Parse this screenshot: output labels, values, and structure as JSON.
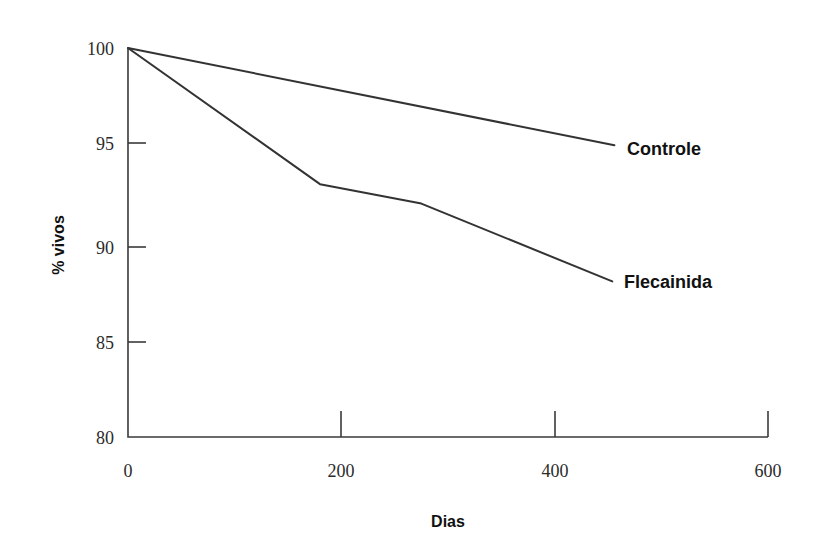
{
  "chart_data": {
    "type": "line",
    "title": "",
    "subtitle": "",
    "xlabel": "Dias",
    "ylabel": "% vivos",
    "xlim": [
      0,
      600
    ],
    "ylim": [
      80,
      100
    ],
    "xticks": [
      0,
      200,
      400,
      600
    ],
    "yticks": [
      80,
      85,
      90,
      95,
      100
    ],
    "xtick_labels": [
      "0",
      "200",
      "400",
      "600"
    ],
    "ytick_labels": [
      "80",
      "85",
      "90",
      "95",
      "100"
    ],
    "grid": false,
    "legend_position": "inline-right-of-line-end",
    "line_color": "#333333",
    "axis_color": "#3a3a3a",
    "background_color": "#ffffff",
    "series": [
      {
        "name": "Controle",
        "label": "Controle",
        "x": [
          0,
          456
        ],
        "y": [
          100,
          95
        ],
        "points": [
          [
            0,
            100
          ],
          [
            456,
            95
          ]
        ]
      },
      {
        "name": "Flecainida",
        "label": "Flecainida",
        "x": [
          0,
          180,
          275,
          454
        ],
        "y": [
          100,
          93,
          92,
          88
        ],
        "points": [
          [
            0,
            100
          ],
          [
            180,
            93
          ],
          [
            275,
            92
          ],
          [
            454,
            88
          ]
        ]
      }
    ]
  },
  "axes": {
    "y_title": "% vivos",
    "x_title": "Dias"
  },
  "labels": {
    "controle": "Controle",
    "flecainida": "Flecainida"
  },
  "ticks": {
    "y": [
      "100",
      "95",
      "90",
      "85",
      "80"
    ],
    "x": [
      "0",
      "200",
      "400",
      "600"
    ]
  }
}
